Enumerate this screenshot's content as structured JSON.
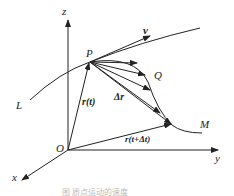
{
  "diagram": {
    "labels": {
      "z": "z",
      "y": "y",
      "x": "x",
      "origin": "O",
      "P": "P",
      "Q": "Q",
      "L": "L",
      "M": "M",
      "v": "v",
      "r_t": "r(t)",
      "delta_r": "Δr",
      "r_t_dt": "r(t+Δt)"
    },
    "caption": "图  质点运动的速度"
  }
}
